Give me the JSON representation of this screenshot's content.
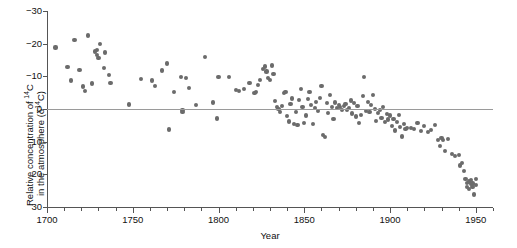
{
  "axes": {
    "xlabel": "Year",
    "ylabel_line1_pre": "Relative concentration of ",
    "ylabel_line1_sup": "14",
    "ylabel_line1_post": "C",
    "ylabel_line2_pre": "in the atmosphere (δ",
    "ylabel_line2_sup": "14",
    "ylabel_line2_post": "C)",
    "xticks": [
      "1700",
      "1750",
      "1800",
      "1850",
      "1900",
      "1950"
    ],
    "yticks": [
      "30",
      "20",
      "10",
      "0",
      "−10",
      "−20",
      "−30"
    ]
  },
  "style": {
    "marker_color": "#6b6b6b",
    "axis_color": "#555555",
    "zero_line_color": "#9a9a9a"
  },
  "chart_data": {
    "type": "scatter",
    "title": "",
    "xlabel": "Year",
    "ylabel": "Relative concentration of 14C in the atmosphere (δ14C)",
    "xlim": [
      1700,
      1960
    ],
    "ylim": [
      -30,
      30
    ],
    "xticks": [
      1700,
      1750,
      1800,
      1850,
      1900,
      1950
    ],
    "yticks": [
      -30,
      -20,
      -10,
      0,
      10,
      20,
      30
    ],
    "x_minor_tick_interval": 10,
    "grid": false,
    "legend": null,
    "annotations": [
      "horizontal reference line at δ14C = 0"
    ],
    "series_name": "δ14C tree-ring measurements",
    "points": [
      [
        1705,
        18.8
      ],
      [
        1712,
        12.9
      ],
      [
        1714,
        8.7
      ],
      [
        1716,
        21.0
      ],
      [
        1719,
        11.9
      ],
      [
        1721,
        6.9
      ],
      [
        1722,
        5.5
      ],
      [
        1724,
        22.5
      ],
      [
        1726,
        7.8
      ],
      [
        1728,
        17.6
      ],
      [
        1729,
        18.0
      ],
      [
        1729,
        16.5
      ],
      [
        1730,
        15.6
      ],
      [
        1731,
        19.9
      ],
      [
        1733,
        12.5
      ],
      [
        1734,
        17.3
      ],
      [
        1736,
        10.4
      ],
      [
        1737,
        7.9
      ],
      [
        1748,
        1.4
      ],
      [
        1755,
        9.2
      ],
      [
        1761,
        8.7
      ],
      [
        1763,
        7.0
      ],
      [
        1767,
        11.8
      ],
      [
        1770,
        13.9
      ],
      [
        1771,
        -6.3
      ],
      [
        1774,
        5.3
      ],
      [
        1778,
        9.8
      ],
      [
        1779,
        -0.3
      ],
      [
        1779,
        -0.8
      ],
      [
        1781,
        9.6
      ],
      [
        1783,
        6.4
      ],
      [
        1787,
        1.2
      ],
      [
        1792,
        16.0
      ],
      [
        1797,
        2.0
      ],
      [
        1799,
        -2.9
      ],
      [
        1800,
        9.8
      ],
      [
        1806,
        9.7
      ],
      [
        1810,
        5.9
      ],
      [
        1812,
        5.4
      ],
      [
        1815,
        6.2
      ],
      [
        1818,
        8.0
      ],
      [
        1821,
        4.9
      ],
      [
        1822,
        5.2
      ],
      [
        1823,
        7.3
      ],
      [
        1824,
        9.0
      ],
      [
        1826,
        12.2
      ],
      [
        1827,
        13.0
      ],
      [
        1828,
        11.5
      ],
      [
        1829,
        9.4
      ],
      [
        1830,
        8.9
      ],
      [
        1831,
        13.3
      ],
      [
        1832,
        10.6
      ],
      [
        1833,
        2.4
      ],
      [
        1834,
        0.6
      ],
      [
        1835,
        0.0
      ],
      [
        1836,
        -1.0
      ],
      [
        1837,
        1.0
      ],
      [
        1838,
        4.8
      ],
      [
        1839,
        5.1
      ],
      [
        1840,
        -2.1
      ],
      [
        1841,
        -3.8
      ],
      [
        1842,
        1.6
      ],
      [
        1843,
        3.2
      ],
      [
        1844,
        -4.6
      ],
      [
        1845,
        -0.9
      ],
      [
        1846,
        -5.0
      ],
      [
        1847,
        2.8
      ],
      [
        1848,
        6.2
      ],
      [
        1849,
        0.5
      ],
      [
        1850,
        -4.4
      ],
      [
        1851,
        -2.0
      ],
      [
        1852,
        3.0
      ],
      [
        1853,
        5.2
      ],
      [
        1854,
        1.1
      ],
      [
        1855,
        -4.5
      ],
      [
        1856,
        0.4
      ],
      [
        1857,
        2.2
      ],
      [
        1858,
        -0.6
      ],
      [
        1859,
        3.4
      ],
      [
        1860,
        7.0
      ],
      [
        1861,
        -8.0
      ],
      [
        1862,
        -8.6
      ],
      [
        1863,
        1.9
      ],
      [
        1864,
        -1.2
      ],
      [
        1865,
        4.4
      ],
      [
        1866,
        0.6
      ],
      [
        1867,
        -3.0
      ],
      [
        1868,
        2.0
      ],
      [
        1869,
        0.2
      ],
      [
        1870,
        1.1
      ],
      [
        1871,
        0.5
      ],
      [
        1872,
        -0.4
      ],
      [
        1873,
        0.8
      ],
      [
        1874,
        1.5
      ],
      [
        1875,
        -0.2
      ],
      [
        1876,
        0.3
      ],
      [
        1877,
        2.6
      ],
      [
        1878,
        -1.4
      ],
      [
        1879,
        1.8
      ],
      [
        1880,
        -2.3
      ],
      [
        1881,
        0.9
      ],
      [
        1882,
        -4.3
      ],
      [
        1883,
        -1.9
      ],
      [
        1884,
        4.0
      ],
      [
        1885,
        9.8
      ],
      [
        1886,
        -0.6
      ],
      [
        1887,
        2.2
      ],
      [
        1888,
        -0.8
      ],
      [
        1889,
        1.2
      ],
      [
        1890,
        4.2
      ],
      [
        1891,
        0.0
      ],
      [
        1892,
        -3.6
      ],
      [
        1893,
        -1.2
      ],
      [
        1894,
        -0.4
      ],
      [
        1895,
        -2.8
      ],
      [
        1896,
        0.6
      ],
      [
        1897,
        -4.0
      ],
      [
        1898,
        -1.5
      ],
      [
        1899,
        -3.2
      ],
      [
        1900,
        -2.0
      ],
      [
        1901,
        -5.2
      ],
      [
        1902,
        -3.0
      ],
      [
        1903,
        -6.6
      ],
      [
        1904,
        -4.1
      ],
      [
        1905,
        -1.8
      ],
      [
        1906,
        -5.4
      ],
      [
        1907,
        -8.4
      ],
      [
        1908,
        -4.6
      ],
      [
        1909,
        -6.0
      ],
      [
        1910,
        -5.7
      ],
      [
        1912,
        -5.9
      ],
      [
        1914,
        -6.2
      ],
      [
        1916,
        -4.4
      ],
      [
        1918,
        -6.8
      ],
      [
        1920,
        -5.2
      ],
      [
        1922,
        -7.1
      ],
      [
        1924,
        -6.5
      ],
      [
        1926,
        -5.0
      ],
      [
        1928,
        -9.4
      ],
      [
        1929,
        -11.4
      ],
      [
        1930,
        -9.0
      ],
      [
        1931,
        -9.6
      ],
      [
        1932,
        -12.8
      ],
      [
        1934,
        -9.2
      ],
      [
        1936,
        -13.7
      ],
      [
        1938,
        -14.5
      ],
      [
        1940,
        -14.0
      ],
      [
        1941,
        -17.3
      ],
      [
        1942,
        -16.6
      ],
      [
        1943,
        -18.9
      ],
      [
        1944,
        -21.5
      ],
      [
        1945,
        -22.6
      ],
      [
        1945,
        -23.8
      ],
      [
        1946,
        -22.2
      ],
      [
        1946,
        -24.4
      ],
      [
        1947,
        -23.0
      ],
      [
        1947,
        -21.8
      ],
      [
        1948,
        -24.0
      ],
      [
        1948,
        -22.8
      ],
      [
        1949,
        -26.2
      ],
      [
        1950,
        -21.4
      ],
      [
        1950,
        -23.2
      ]
    ]
  }
}
